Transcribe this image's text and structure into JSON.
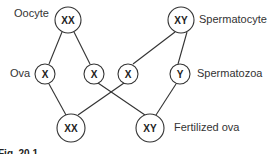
{
  "diagram": {
    "nodes": {
      "oocyte": {
        "label": "XX"
      },
      "spermatocyte": {
        "label": "XY"
      },
      "ovum1": {
        "label": "X"
      },
      "ovum2": {
        "label": "X"
      },
      "sperm_x": {
        "label": "X"
      },
      "sperm_y": {
        "label": "Y"
      },
      "fert_xx": {
        "label": "XX"
      },
      "fert_xy": {
        "label": "XY"
      }
    },
    "labels": {
      "oocyte": "Oocyte",
      "spermatocyte": "Spermatocyte",
      "ova": "Ova",
      "spermatozoa": "Spermatozoa",
      "fertilized_ova": "Fertilized ova"
    },
    "caption": "Fig. 20.1"
  }
}
